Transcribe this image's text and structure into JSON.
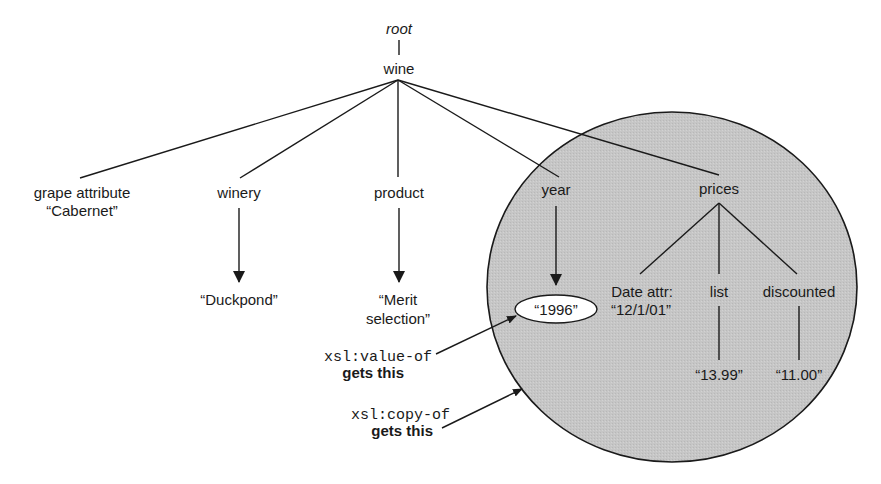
{
  "diagram": {
    "root": {
      "label": "root"
    },
    "wine": {
      "label": "wine"
    },
    "children": {
      "grape": {
        "line1": "grape attribute",
        "line2": "“Cabernet”"
      },
      "winery": {
        "label": "winery",
        "value": "“Duckpond”"
      },
      "product": {
        "label": "product",
        "value_line1": "“Merit",
        "value_line2": "selection”"
      },
      "year": {
        "label": "year",
        "value": "“1996”"
      },
      "prices": {
        "label": "prices",
        "date": {
          "line1": "Date attr:",
          "line2": "“12/1/01”"
        },
        "list": {
          "label": "list",
          "value": "“13.99”"
        },
        "discounted": {
          "label": "discounted",
          "value": "“11.00”"
        }
      }
    },
    "annotations": {
      "value_of": {
        "code": "xsl:value-of",
        "caption": "gets this"
      },
      "copy_of": {
        "code": "xsl:copy-of",
        "caption": "gets this"
      }
    },
    "colors": {
      "highlight_fill": "#c9c9c9",
      "ink": "#1a1a1a",
      "background": "#ffffff"
    }
  }
}
